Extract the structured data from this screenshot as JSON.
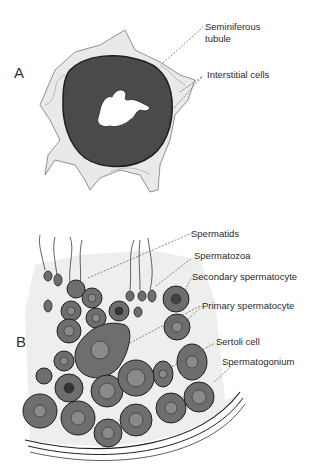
{
  "figure": {
    "panels": [
      {
        "id": "A",
        "letter": "A",
        "labels": {
          "seminiferous_tubule": "Seminiferous\ntubule",
          "seminiferous_line1": "Seminiferous",
          "seminiferous_line2": "tubule",
          "interstitial_cells": "Interstitial cells"
        }
      },
      {
        "id": "B",
        "letter": "B",
        "labels": {
          "spermatids": "Spermatids",
          "spermatozoa": "Spermatozoa",
          "secondary_spermatocyte": "Secondary spermatocyte",
          "primary_spermatocyte": "Primary spermatocyte",
          "sertoli_cell": "Sertoli cell",
          "spermatogonium": "Spermatogonium"
        }
      }
    ],
    "colors": {
      "tubule_fill": "#4a4a4a",
      "cell_fill": "#6e6e6e",
      "nucleus_fill": "#8a8a8a",
      "outline": "#1e1e1e",
      "stroma": "#d8d8d8",
      "leader_line": "#555555"
    }
  }
}
